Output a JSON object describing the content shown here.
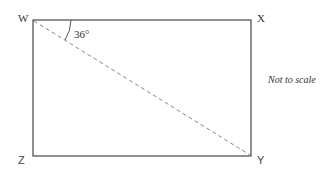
{
  "diagram": {
    "vertices": [
      {
        "id": "W",
        "label": "W"
      },
      {
        "id": "X",
        "label": "X"
      },
      {
        "id": "Y",
        "label": "Y"
      },
      {
        "id": "Z",
        "label": "Z"
      }
    ],
    "shape": "rectangle",
    "diagonal": {
      "from": "W",
      "to": "Y",
      "style": "dashed"
    },
    "angle": {
      "at": "W",
      "between": [
        "WX",
        "WY"
      ],
      "label": "36°"
    },
    "note": "Not to scale",
    "colors": {
      "line": "#555555",
      "dashed": "#888888",
      "text": "#333333"
    }
  }
}
